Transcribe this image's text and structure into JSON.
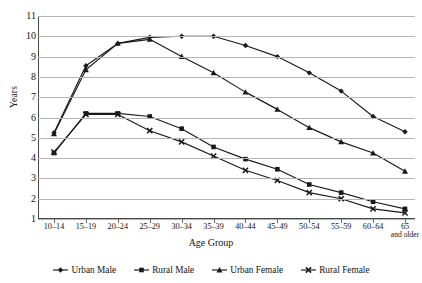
{
  "chart_data": {
    "type": "line",
    "title": "",
    "xlabel": "Age Group",
    "ylabel": "Years",
    "ylim": [
      1,
      11
    ],
    "yticks": [
      1,
      2,
      3,
      4,
      5,
      6,
      7,
      8,
      9,
      10,
      11
    ],
    "grid": true,
    "legend_position": "bottom",
    "categories": [
      "10–14",
      "15–19",
      "20–24",
      "25–29",
      "30–34",
      "35–39",
      "40–44",
      "45–49",
      "50–54",
      "55–59",
      "60–64",
      "65\nand older"
    ],
    "series": [
      {
        "name": "Urban Male",
        "marker": "diamond",
        "values": [
          5.25,
          8.55,
          9.65,
          9.95,
          10.0,
          10.0,
          9.55,
          9.0,
          8.2,
          7.3,
          6.05,
          5.3
        ]
      },
      {
        "name": "Rural Male",
        "marker": "square",
        "values": [
          4.25,
          6.2,
          6.2,
          6.05,
          5.45,
          4.55,
          3.95,
          3.45,
          2.7,
          2.3,
          1.85,
          1.5
        ]
      },
      {
        "name": "Urban Female",
        "marker": "triangle",
        "values": [
          5.2,
          8.35,
          9.65,
          9.85,
          9.0,
          8.2,
          7.25,
          6.4,
          5.5,
          4.8,
          4.25,
          3.35
        ]
      },
      {
        "name": "Rural Female",
        "marker": "cross",
        "values": [
          4.3,
          6.15,
          6.15,
          5.35,
          4.8,
          4.1,
          3.4,
          2.9,
          2.3,
          2.0,
          1.5,
          1.3
        ]
      }
    ]
  },
  "axes": {
    "y_title": "Years",
    "x_title": "Age Group",
    "y_tick_labels": [
      "11",
      "10",
      "9",
      "8",
      "7",
      "6",
      "5",
      "4",
      "3",
      "2",
      "1"
    ],
    "x_tick_labels": [
      {
        "main": "10–14",
        "sub": ""
      },
      {
        "main": "15–19",
        "sub": ""
      },
      {
        "main": "20–24",
        "sub": ""
      },
      {
        "main": "25–29",
        "sub": ""
      },
      {
        "main": "30–34",
        "sub": ""
      },
      {
        "main": "35–39",
        "sub": ""
      },
      {
        "main": "40–44",
        "sub": ""
      },
      {
        "main": "45–49",
        "sub": ""
      },
      {
        "main": "50–54",
        "sub": ""
      },
      {
        "main": "55–59",
        "sub": ""
      },
      {
        "main": "60–64",
        "sub": ""
      },
      {
        "main": "65",
        "sub": "and older"
      }
    ]
  },
  "legend": {
    "items": [
      {
        "label": "Urban Male",
        "marker": "diamond"
      },
      {
        "label": "Rural Male",
        "marker": "square"
      },
      {
        "label": "Urban Female",
        "marker": "triangle"
      },
      {
        "label": "Rural Female",
        "marker": "cross"
      }
    ]
  },
  "colors": {
    "line": "#1a1a1a",
    "grid": "#b5b5b5",
    "axis": "#4a4a4a",
    "text": "#141414",
    "background": "#ffffff"
  }
}
